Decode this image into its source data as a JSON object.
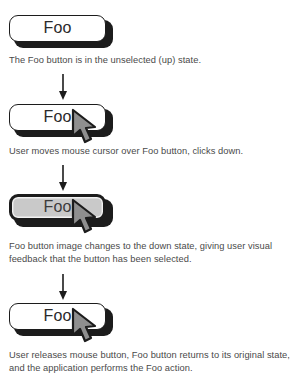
{
  "figure": {
    "button_label": "Foo",
    "stages": [
      {
        "id": "stage-1-up",
        "button_label": "Foo",
        "button_state": "up",
        "has_cursor": false,
        "caption": "The Foo button is in the unselected (up) state."
      },
      {
        "id": "stage-2-mouse-down",
        "button_label": "Foo",
        "button_state": "up",
        "has_cursor": true,
        "caption": "User moves mouse cursor over Foo button, clicks down."
      },
      {
        "id": "stage-3-down",
        "button_label": "Foo",
        "button_state": "down",
        "has_cursor": true,
        "caption": "Foo button image changes to the down state, giving user visual feedback that the button has been selected."
      },
      {
        "id": "stage-4-released",
        "button_label": "Foo",
        "button_state": "up",
        "has_cursor": true,
        "caption": "User releases mouse button, Foo button returns to its original state, and the application performs the Foo action."
      }
    ],
    "connectors": [
      {
        "name": "connector-1-to-2"
      },
      {
        "name": "connector-2-to-3"
      },
      {
        "name": "connector-3-to-4"
      }
    ],
    "colors": {
      "button_up_fill": "#ffffff",
      "button_down_fill": "#c9c9c9",
      "outline": "#1c1c1c",
      "cursor_fill": "#8f8f8f",
      "cursor_outline": "#1c1c1c",
      "caption_text": "#4a4a4a",
      "background": "#ffffff"
    }
  }
}
